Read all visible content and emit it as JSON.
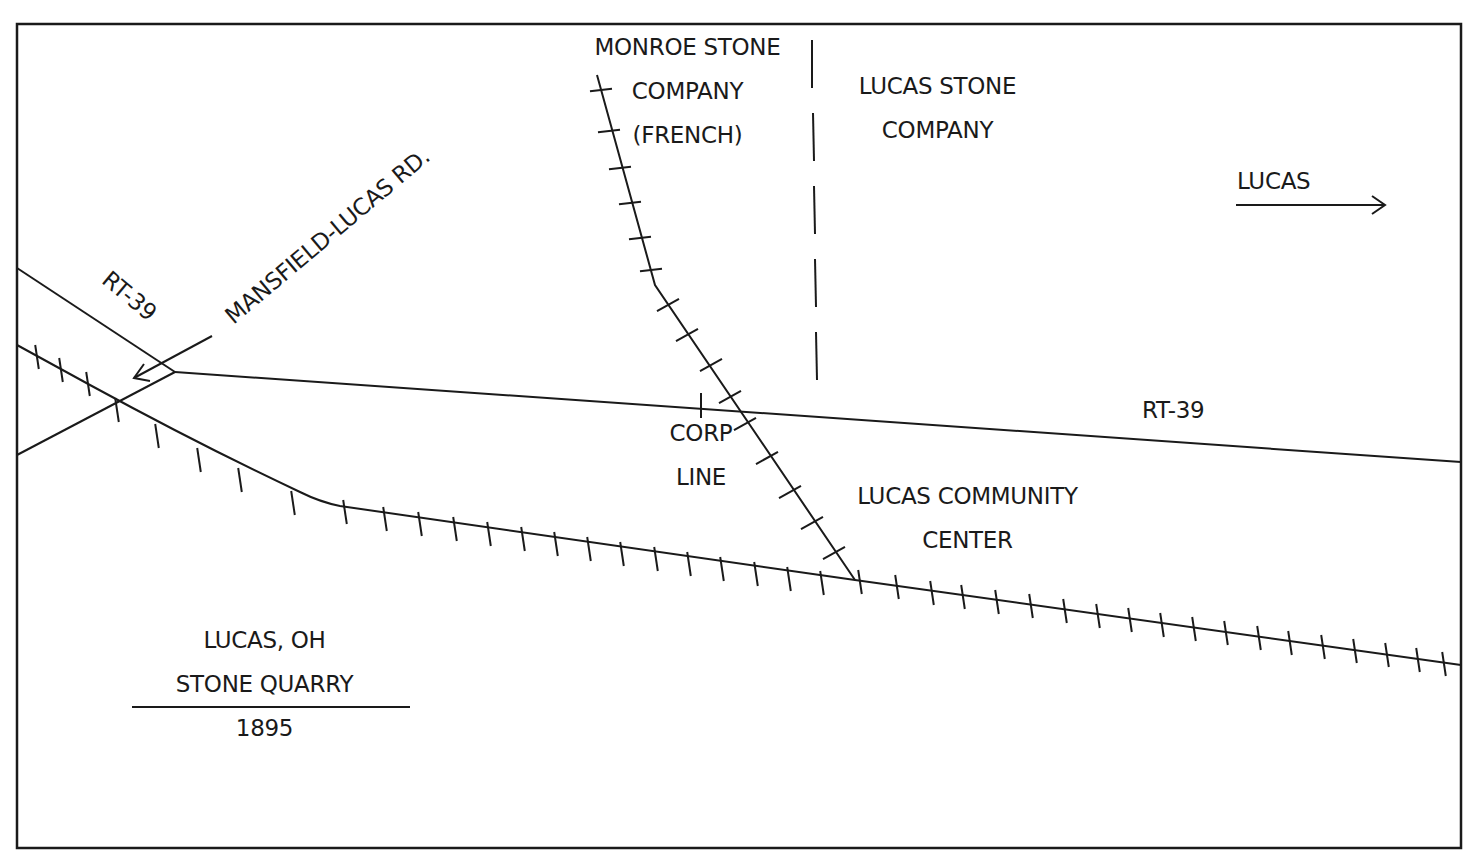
{
  "map": {
    "title_block": {
      "line1": "LUCAS, OH",
      "line2": "STONE QUARRY",
      "year": "1895"
    },
    "labels": {
      "monroe_line1": "MONROE STONE",
      "monroe_line2": "COMPANY",
      "monroe_line3": "(FRENCH)",
      "lucas_stone_line1": "LUCAS STONE",
      "lucas_stone_line2": "COMPANY",
      "lucas_direction": "LUCAS",
      "mansfield_road": "MANSFIELD-LUCAS RD.",
      "rt39_left": "RT-39",
      "rt39_right": "RT-39",
      "corp_line1": "CORP",
      "corp_line2": "LINE",
      "community_line1": "LUCAS COMMUNITY",
      "community_line2": "CENTER"
    },
    "colors": {
      "ink": "#1a1a1a",
      "background": "#ffffff"
    }
  }
}
